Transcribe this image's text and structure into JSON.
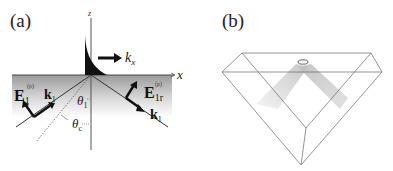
{
  "panel_a": {
    "label": "(a)",
    "axis_z": "z",
    "axis_x": "x",
    "wave_vector_label": "k",
    "wave_vector_sub": "x",
    "incident_field": "E",
    "incident_field_sub": "1",
    "incident_field_sup": "(p)",
    "incident_k": "k",
    "incident_k_sub": "1",
    "reflected_field": "E",
    "reflected_field_sub": "1r",
    "reflected_field_sup": "(p)",
    "reflected_k": "k",
    "reflected_k_sub": "1",
    "angle_incidence": "θ",
    "angle_incidence_sub": "1",
    "angle_critical": "θ",
    "angle_critical_sub": "c"
  },
  "panel_b": {
    "label": "(b)"
  },
  "colors": {
    "line": "#333333",
    "fill_dark": "#111111",
    "medium_top": "#9a9a9a",
    "prism_line": "#555555",
    "beam": "#cccccc"
  }
}
